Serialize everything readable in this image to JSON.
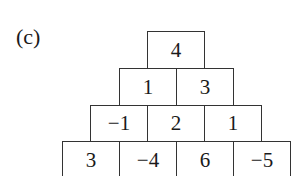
{
  "label": "(c)",
  "pyramid": {
    "rows": [
      [
        "4"
      ],
      [
        "1",
        "3"
      ],
      [
        "−1",
        "2",
        "1"
      ],
      [
        "3",
        "−4",
        "6",
        "−5"
      ]
    ]
  },
  "colors": {
    "line": "#333333",
    "text": "#1a1a1a",
    "background": "#ffffff"
  }
}
